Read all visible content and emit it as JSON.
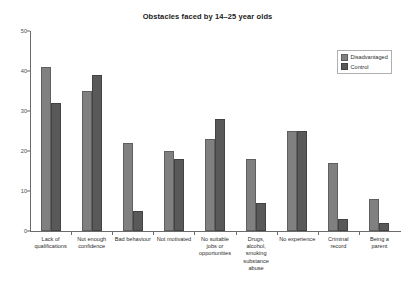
{
  "chart_data": {
    "type": "bar",
    "title": "Obstacles faced by 14–25 year olds",
    "xlabel": "",
    "ylabel": "",
    "ylim": [
      0,
      50
    ],
    "yticks": [
      0,
      10,
      20,
      30,
      40,
      50
    ],
    "grid": false,
    "legend_position": "top-right",
    "categories": [
      "Lack of\nqualifications",
      "Not enough\nconfidence",
      "Bad behaviour",
      "Not motivated",
      "No suitable\njobs or\nopportunities",
      "Drugs,\nalcohol,\nsmoking\nsubstance\nabuse",
      "No experience",
      "Criminal\nrecord",
      "Being a\nparent"
    ],
    "series": [
      {
        "name": "Disadvantaged",
        "color": "#808080",
        "values": [
          41,
          35,
          22,
          20,
          23,
          18,
          25,
          17,
          8
        ]
      },
      {
        "name": "Control",
        "color": "#595959",
        "values": [
          32,
          39,
          5,
          18,
          28,
          7,
          25,
          3,
          2
        ]
      }
    ]
  },
  "legend": {
    "items": [
      {
        "label": "Disadvantaged"
      },
      {
        "label": "Control"
      }
    ]
  }
}
